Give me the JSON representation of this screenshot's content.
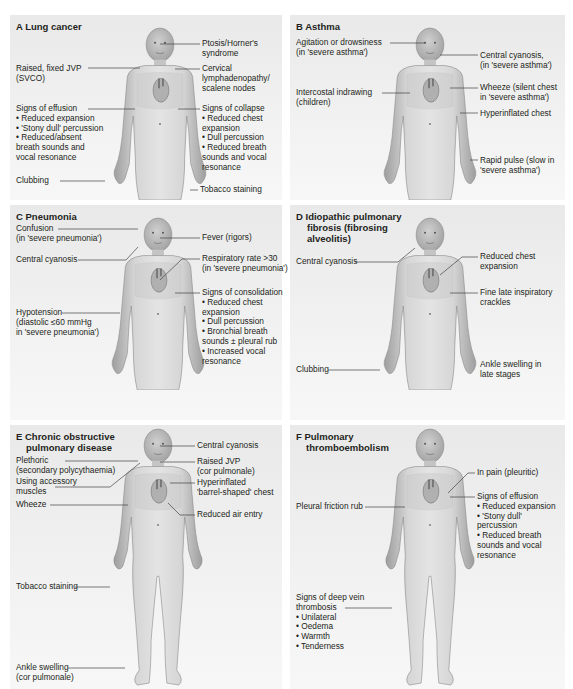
{
  "panels": {
    "a": {
      "title": "A  Lung cancer",
      "labels": {
        "ptosis": [
          "Ptosis/Horner's",
          "syndrome"
        ],
        "jvp": [
          "Raised, fixed JVP",
          "(SVCO)"
        ],
        "cervical": [
          "Cervical",
          "lymphadenopathy/",
          "scalene nodes"
        ],
        "effusion_head": "Signs of effusion",
        "effusion_items": [
          "• Reduced expansion",
          "• 'Stony dull' percussion",
          "• Reduced/absent",
          "  breath sounds and",
          "  vocal resonance"
        ],
        "collapse_head": "Signs of collapse",
        "collapse_items": [
          "• Reduced chest",
          "  expansion",
          "• Dull percussion",
          "• Reduced breath",
          "  sounds and vocal",
          "  resonance"
        ],
        "clubbing": "Clubbing",
        "tobacco": "Tobacco staining"
      }
    },
    "b": {
      "title": "B  Asthma",
      "labels": {
        "agitation": [
          "Agitation or drowsiness",
          "(in 'severe asthma')"
        ],
        "cyanosis": [
          "Central cyanosis,",
          "(in 'severe asthma')"
        ],
        "intercostal": [
          "Intercostal indrawing",
          "(children)"
        ],
        "wheeze": [
          "Wheeze (silent chest",
          "in 'severe asthma')"
        ],
        "hyperinflated": "Hyperinflated chest",
        "pulse": [
          "Rapid pulse (slow in",
          "'severe asthma')"
        ]
      }
    },
    "c": {
      "title": "C  Pneumonia",
      "labels": {
        "confusion": [
          "Confusion",
          "(in 'severe pneumonia')"
        ],
        "fever": "Fever (rigors)",
        "cyanosis": "Central cyanosis",
        "resp": [
          "Respiratory rate >30",
          "(in 'severe pneumonia')"
        ],
        "consolidation_head": "Signs of consolidation",
        "consolidation_items": [
          "• Reduced chest",
          "  expansion",
          "• Dull percussion",
          "• Bronchial breath",
          "  sounds ± pleural rub",
          "• Increased vocal",
          "  resonance"
        ],
        "hypotension": [
          "Hypotension",
          "(diastolic ≤60 mmHg",
          "in 'severe pneumonia')"
        ]
      }
    },
    "d": {
      "title": [
        "D  Idiopathic pulmonary",
        "    fibrosis (fibrosing",
        "    alveolitis)"
      ],
      "labels": {
        "cyanosis": "Central cyanosis",
        "reduced": [
          "Reduced chest",
          "expansion"
        ],
        "crackles": [
          "Fine late inspiratory",
          "crackles"
        ],
        "clubbing": "Clubbing",
        "ankle": [
          "Ankle swelling in",
          "late stages"
        ]
      }
    },
    "e": {
      "title": [
        "E  Chronic obstructive",
        "    pulmonary disease"
      ],
      "labels": {
        "cyanosis": "Central cyanosis",
        "plethoric": [
          "Plethoric",
          "(secondary polycythaemia)"
        ],
        "jvp": [
          "Raised JVP",
          "(cor pulmonale)"
        ],
        "accessory": [
          "Using accessory",
          "muscles"
        ],
        "hyperinflated": [
          "Hyperinflated",
          "'barrel-shaped' chest"
        ],
        "wheeze": "Wheeze",
        "air": "Reduced air entry",
        "tobacco": "Tobacco staining",
        "ankle": [
          "Ankle swelling",
          "(cor pulmonale)"
        ]
      }
    },
    "f": {
      "title": [
        "F  Pulmonary",
        "    thromboembolism"
      ],
      "labels": {
        "pain": "In pain (pleuritic)",
        "rub": "Pleural friction rub",
        "effusion_head": "Signs of effusion",
        "effusion_items": [
          "• Reduced expansion",
          "• 'Stony dull'",
          "  percussion",
          "• Reduced breath",
          "  sounds and vocal",
          "  resonance"
        ],
        "dvt_head": [
          "Signs of deep vein",
          "thrombosis"
        ],
        "dvt_items": [
          "• Unilateral",
          "• Oedema",
          "• Warmth",
          "• Tenderness"
        ]
      }
    }
  },
  "colors": {
    "panel_bg": "#ececec",
    "skin": "#d4d4d4",
    "heart": "#b0b0b0",
    "leader": "#444444"
  }
}
